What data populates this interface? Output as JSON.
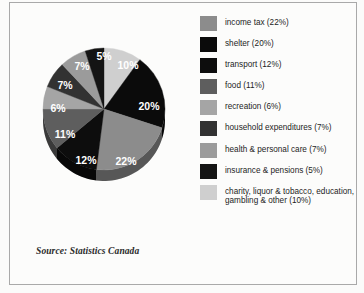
{
  "chart_data": {
    "type": "pie",
    "title": "",
    "subtitle": "",
    "xlabel": "",
    "ylabel": "",
    "source": "Source: Statistics Canada",
    "legend_position": "right",
    "start_angle_deg": 0,
    "direction": "clockwise",
    "categories": [
      "income tax",
      "shelter",
      "transport",
      "food",
      "recreation",
      "household expenditures",
      "health & personal care",
      "insurance & pensions",
      "charity, liquor & tobacco, education, gambling & other"
    ],
    "values": [
      22,
      20,
      12,
      11,
      6,
      7,
      7,
      5,
      10
    ],
    "units": "percent",
    "total": 100,
    "slices": [
      {
        "label": "charity, liquor & tobacco, education, gambling & other",
        "value": 10,
        "slice_label": "10%",
        "color": "#cfcfcf",
        "start_deg": 0,
        "end_deg": 36,
        "label_x": 104,
        "label_y": 47
      },
      {
        "label": "shelter",
        "value": 20,
        "slice_label": "20%",
        "color": "#0b0b0b",
        "start_deg": 36,
        "end_deg": 108,
        "label_x": 125,
        "label_y": 88
      },
      {
        "label": "income tax",
        "value": 22,
        "slice_label": "22%",
        "color": "#8c8c8c",
        "start_deg": 108,
        "end_deg": 187.2,
        "label_x": 102,
        "label_y": 143
      },
      {
        "label": "transport",
        "value": 12,
        "slice_label": "12%",
        "color": "#0d0d0d",
        "start_deg": 187.2,
        "end_deg": 230.4,
        "label_x": 62,
        "label_y": 142
      },
      {
        "label": "food",
        "value": 11,
        "slice_label": "11%",
        "color": "#5e5e5e",
        "start_deg": 230.4,
        "end_deg": 270,
        "label_x": 41,
        "label_y": 116
      },
      {
        "label": "recreation",
        "value": 6,
        "slice_label": "6%",
        "color": "#a5a5a5",
        "start_deg": 270,
        "end_deg": 291.6,
        "label_x": 34,
        "label_y": 90
      },
      {
        "label": "household expenditures",
        "value": 7,
        "slice_label": "7%",
        "color": "#323232",
        "start_deg": 291.6,
        "end_deg": 316.8,
        "label_x": 41,
        "label_y": 67
      },
      {
        "label": "health & personal care",
        "value": 7,
        "slice_label": "7%",
        "color": "#9b9b9b",
        "start_deg": 316.8,
        "end_deg": 342,
        "label_x": 58,
        "label_y": 48
      },
      {
        "label": "insurance & pensions",
        "value": 5,
        "slice_label": "5%",
        "color": "#141414",
        "start_deg": 342,
        "end_deg": 360,
        "label_x": 80,
        "label_y": 38
      }
    ]
  },
  "legend": {
    "items": [
      {
        "label": "income tax (22%)",
        "color": "#8c8c8c",
        "multiline": false
      },
      {
        "label": "shelter (20%)",
        "color": "#0b0b0b",
        "multiline": false
      },
      {
        "label": "transport  (12%)",
        "color": "#0d0d0d",
        "multiline": false
      },
      {
        "label": "food (11%)",
        "color": "#5e5e5e",
        "multiline": false
      },
      {
        "label": "recreation (6%)",
        "color": "#a5a5a5",
        "multiline": false
      },
      {
        "label": "household expenditures (7%)",
        "color": "#323232",
        "multiline": false
      },
      {
        "label": "health & personal care (7%)",
        "color": "#9b9b9b",
        "multiline": false
      },
      {
        "label": "insurance & pensions (5%)",
        "color": "#141414",
        "multiline": false
      },
      {
        "label": "charity, liquor & tobacco, education, gambling & other (10%)",
        "color": "#cfcfcf",
        "multiline": true
      }
    ]
  },
  "source": {
    "text": "Source: Statistics Canada"
  },
  "style": {
    "background": "#fcfcfb",
    "border_color": "#a9a9a9",
    "pie_base_color": "#d6d6d6",
    "slice_label_color": "#ffffff"
  }
}
